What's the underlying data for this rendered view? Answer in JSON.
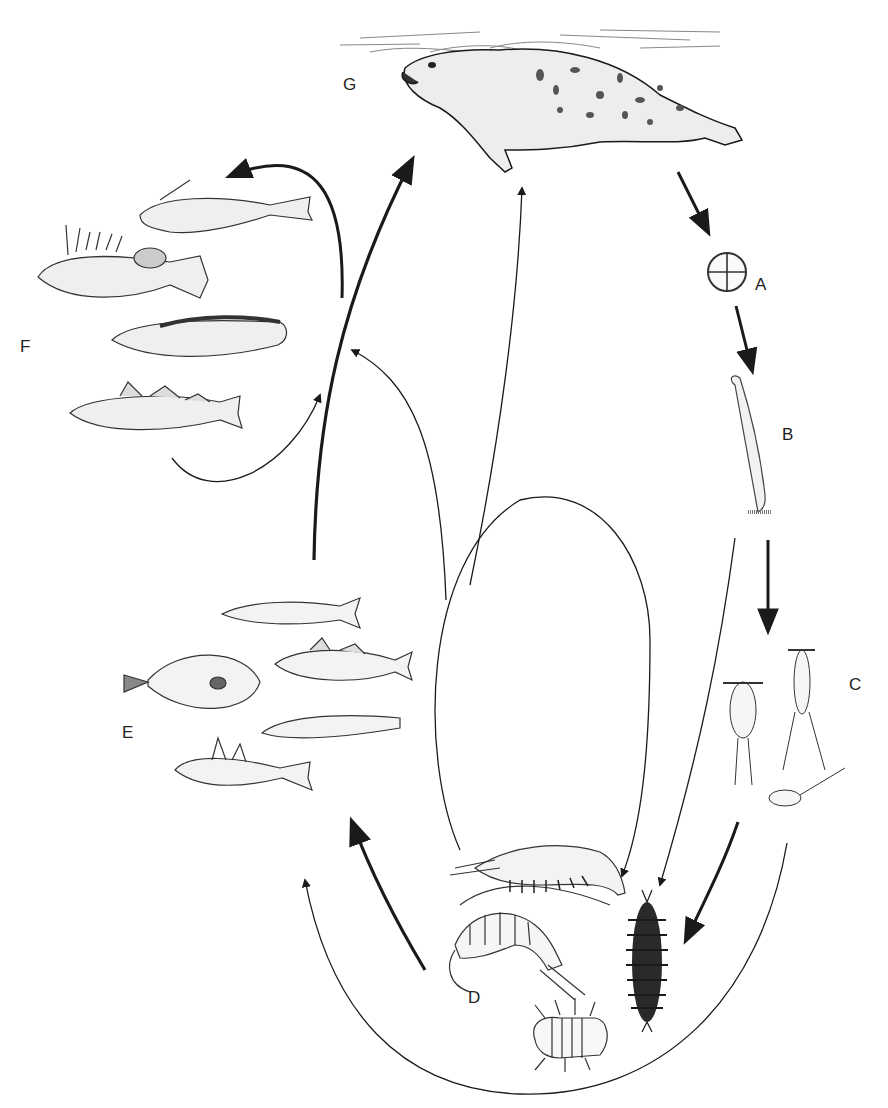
{
  "diagram": {
    "type": "food-web / parasite life-cycle illustration",
    "background": "#ffffff",
    "ink_color": "#1a1a1a",
    "nodes": [
      {
        "id": "G",
        "label": "G",
        "depicts": "seal swimming at water surface",
        "x": 350,
        "y": 78
      },
      {
        "id": "A",
        "label": "A",
        "depicts": "egg (four-celled)",
        "x": 760,
        "y": 284
      },
      {
        "id": "B",
        "label": "B",
        "depicts": "elongated larva",
        "x": 792,
        "y": 432
      },
      {
        "id": "C",
        "label": "C",
        "depicts": "copepods (three)",
        "x": 855,
        "y": 682
      },
      {
        "id": "D",
        "label": "D",
        "depicts": "mysid, amphipod, isopod, polychaete worm",
        "x": 475,
        "y": 1098
      },
      {
        "id": "E",
        "label": "E",
        "depicts": "small fishes (smelt, flatfish, cod, eelpout, sculpin)",
        "x": 130,
        "y": 738
      },
      {
        "id": "F",
        "label": "F",
        "depicts": "larger fishes (anglerfish, sculpin, eelpout, cod)",
        "x": 46,
        "y": 345
      }
    ],
    "edges": [
      {
        "from": "G",
        "to": "A",
        "weight": "thick"
      },
      {
        "from": "A",
        "to": "B",
        "weight": "thick"
      },
      {
        "from": "B",
        "to": "C",
        "weight": "thick"
      },
      {
        "from": "B",
        "to": "D",
        "weight": "thin"
      },
      {
        "from": "C",
        "to": "D",
        "weight": "thick"
      },
      {
        "from": "C",
        "to": "E",
        "weight": "thin"
      },
      {
        "from": "D",
        "to": "E",
        "weight": "thick"
      },
      {
        "from": "D",
        "to": "F",
        "weight": "thin"
      },
      {
        "from": "D",
        "to": "G",
        "weight": "thin"
      },
      {
        "from": "D",
        "to": "D",
        "weight": "thin"
      },
      {
        "from": "E",
        "to": "G",
        "weight": "thick"
      },
      {
        "from": "E",
        "to": "F",
        "weight": "thick"
      },
      {
        "from": "F",
        "to": "G",
        "weight": "thin"
      }
    ]
  }
}
